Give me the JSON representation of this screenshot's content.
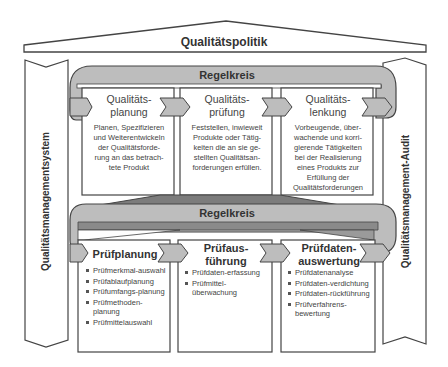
{
  "roof": {
    "title": "Qualitätspolitik"
  },
  "pillars": {
    "left": "Qualitätsmanagementsystem",
    "right": "Qualitätsmanagement-Audit"
  },
  "upper_loop": {
    "title": "Regelkreis",
    "boxes": [
      {
        "title_1": "Qualitäts-",
        "title_2": "planung",
        "desc": [
          "Planen, Spezifizieren",
          "und Weiterentwickeln",
          "der Qualitätsforde-",
          "rung an das betrach-",
          "tete Produkt"
        ]
      },
      {
        "title_1": "Qualitäts-",
        "title_2": "prüfung",
        "desc": [
          "Feststellen, inwieweit",
          "Produkte oder Tätig-",
          "keiten die an sie ge-",
          "stellten Qualitätsan-",
          "forderungen erfüllen."
        ]
      },
      {
        "title_1": "Qualitäts-",
        "title_2": "lenkung",
        "desc": [
          "Vorbeugende, über-",
          "wachende und korri-",
          "gierende Tätigkeiten",
          "bei der Realisierung",
          "eines Produkts zur",
          "Erfüllung der",
          "Qualitätsforderungen"
        ]
      }
    ]
  },
  "lower_loop": {
    "title": "Regelkreis",
    "boxes": [
      {
        "title_1": "Prüfplanung",
        "title_2": "",
        "items": [
          "Prüfmerkmal-auswahl",
          "Prüfablaufplanung",
          "Prüfumfangs-planung",
          "Prüfmethoden-planung",
          "Prüfmittelauswahl"
        ]
      },
      {
        "title_1": "Prüfaus-",
        "title_2": "führung",
        "items": [
          "Prüfdaten-erfassung",
          "Prüfmittel-überwachung"
        ]
      },
      {
        "title_1": "Prüfdaten-",
        "title_2": "auswertung",
        "items": [
          "Prüfdatenanalyse",
          "Prüfdaten-verdichtung",
          "Prüfdaten-rückführung",
          "Prüfverfahrens-bewertung"
        ]
      }
    ]
  },
  "colors": {
    "loop_fill": "#b9b9b9",
    "dark_fill": "#7a7a7a",
    "outline": "#444444",
    "box_fill": "#ffffff"
  }
}
